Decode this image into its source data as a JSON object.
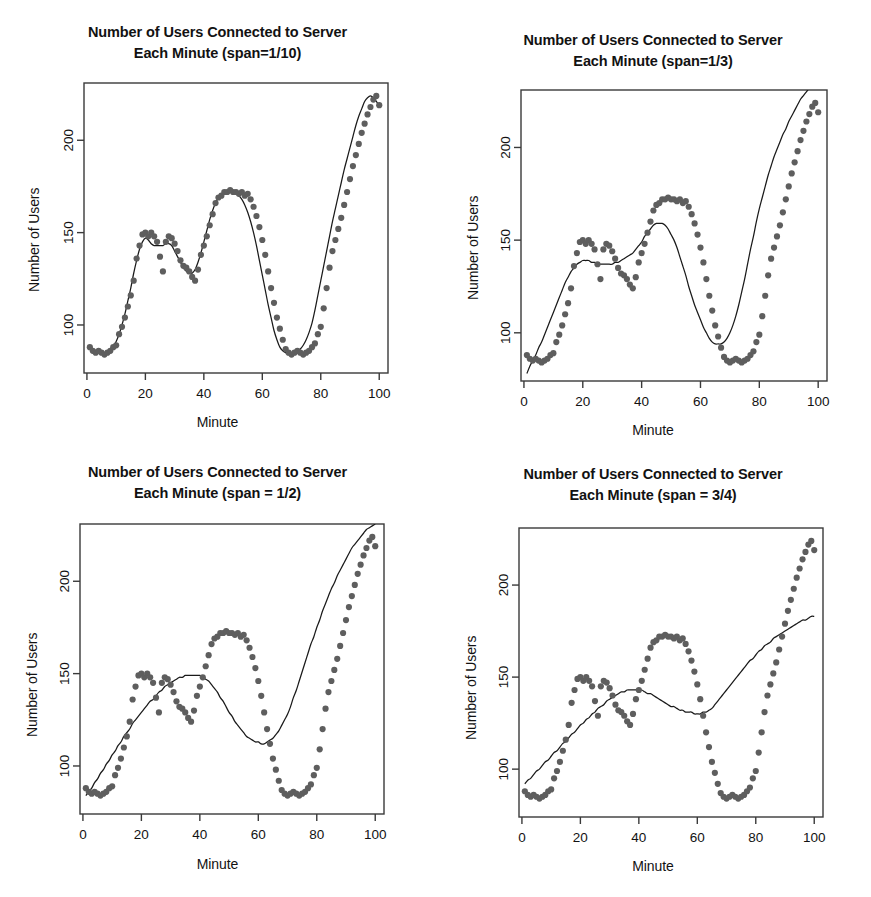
{
  "figure": {
    "width": 871,
    "height": 897,
    "background": "#ffffff",
    "point_color": "#5e5e5e",
    "line_color": "#1a1a1a",
    "axis_color": "#3a3a3a",
    "layout": "2x2 panel grid"
  },
  "chart_data": [
    {
      "id": "panel-span-1-10",
      "type": "scatter",
      "title": "Number of Users Connected to Server Each Minute (span=1/10)",
      "title_line1": "Number of Users Connected to Server",
      "title_line2": "Each Minute (span=1/10)",
      "span_label": "span=1/10",
      "span_value": 0.1,
      "xlabel": "Minute",
      "ylabel": "Number of Users",
      "xlim": [
        -1,
        103
      ],
      "ylim": [
        74,
        231
      ],
      "xticks": [
        0,
        20,
        40,
        60,
        80,
        100
      ],
      "yticks": [
        100,
        150,
        200
      ],
      "grid": false,
      "legend": "none",
      "x": [
        1,
        2,
        3,
        4,
        5,
        6,
        7,
        8,
        9,
        10,
        11,
        12,
        13,
        14,
        15,
        16,
        17,
        18,
        19,
        20,
        21,
        22,
        23,
        24,
        25,
        26,
        27,
        28,
        29,
        30,
        31,
        32,
        33,
        34,
        35,
        36,
        37,
        38,
        39,
        40,
        41,
        42,
        43,
        44,
        45,
        46,
        47,
        48,
        49,
        50,
        51,
        52,
        53,
        54,
        55,
        56,
        57,
        58,
        59,
        60,
        61,
        62,
        63,
        64,
        65,
        66,
        67,
        68,
        69,
        70,
        71,
        72,
        73,
        74,
        75,
        76,
        77,
        78,
        79,
        80,
        81,
        82,
        83,
        84,
        85,
        86,
        87,
        88,
        89,
        90,
        91,
        92,
        93,
        94,
        95,
        96,
        97,
        98,
        99,
        100
      ],
      "y": [
        88,
        86,
        85,
        86,
        85,
        84,
        85,
        86,
        88,
        89,
        95,
        99,
        104,
        110,
        116,
        124,
        136,
        143,
        149,
        150,
        148,
        150,
        148,
        145,
        137,
        129,
        145,
        148,
        147,
        144,
        140,
        135,
        132,
        131,
        129,
        126,
        124,
        130,
        138,
        143,
        148,
        154,
        160,
        166,
        169,
        170,
        172,
        172,
        173,
        172,
        172,
        171,
        172,
        170,
        171,
        168,
        164,
        159,
        153,
        146,
        138,
        129,
        120,
        112,
        104,
        98,
        92,
        87,
        85,
        84,
        85,
        86,
        85,
        84,
        85,
        86,
        88,
        90,
        95,
        99,
        109,
        120,
        131,
        140,
        146,
        152,
        158,
        165,
        172,
        179,
        186,
        192,
        198,
        204,
        209,
        214,
        218,
        222,
        224,
        219
      ],
      "smooth_y": [
        87,
        86,
        85,
        85,
        85,
        85,
        85,
        86,
        88,
        91,
        95,
        100,
        106,
        113,
        120,
        128,
        135,
        141,
        145,
        147,
        146,
        144,
        143,
        143,
        143,
        143,
        144,
        144,
        143,
        140,
        137,
        134,
        131,
        129,
        128,
        128,
        130,
        134,
        139,
        145,
        151,
        157,
        162,
        166,
        169,
        171,
        172,
        172,
        172,
        172,
        171,
        170,
        168,
        165,
        161,
        156,
        150,
        143,
        135,
        127,
        119,
        111,
        104,
        97,
        92,
        88,
        86,
        85,
        84,
        84,
        85,
        86,
        87,
        89,
        92,
        96,
        101,
        108,
        116,
        124,
        132,
        140,
        148,
        156,
        163,
        170,
        177,
        184,
        190,
        196,
        202,
        208,
        213,
        217,
        221,
        223,
        224,
        223,
        221,
        219
      ]
    },
    {
      "id": "panel-span-1-3",
      "type": "scatter",
      "title": "Number of Users Connected to Server Each Minute (span=1/3)",
      "title_line1": "Number of Users Connected to Server",
      "title_line2": "Each Minute (span=1/3)",
      "span_label": "span=1/3",
      "span_value": 0.3333,
      "xlabel": "Minute",
      "ylabel": "Number of Users",
      "xlim": [
        -1,
        103
      ],
      "ylim": [
        74,
        231
      ],
      "xticks": [
        0,
        20,
        40,
        60,
        80,
        100
      ],
      "yticks": [
        100,
        150,
        200
      ],
      "grid": false,
      "legend": "none",
      "x": [
        1,
        2,
        3,
        4,
        5,
        6,
        7,
        8,
        9,
        10,
        11,
        12,
        13,
        14,
        15,
        16,
        17,
        18,
        19,
        20,
        21,
        22,
        23,
        24,
        25,
        26,
        27,
        28,
        29,
        30,
        31,
        32,
        33,
        34,
        35,
        36,
        37,
        38,
        39,
        40,
        41,
        42,
        43,
        44,
        45,
        46,
        47,
        48,
        49,
        50,
        51,
        52,
        53,
        54,
        55,
        56,
        57,
        58,
        59,
        60,
        61,
        62,
        63,
        64,
        65,
        66,
        67,
        68,
        69,
        70,
        71,
        72,
        73,
        74,
        75,
        76,
        77,
        78,
        79,
        80,
        81,
        82,
        83,
        84,
        85,
        86,
        87,
        88,
        89,
        90,
        91,
        92,
        93,
        94,
        95,
        96,
        97,
        98,
        99,
        100
      ],
      "y": [
        88,
        86,
        85,
        86,
        85,
        84,
        85,
        86,
        88,
        89,
        95,
        99,
        104,
        110,
        116,
        124,
        136,
        143,
        149,
        150,
        148,
        150,
        148,
        145,
        137,
        129,
        145,
        148,
        147,
        144,
        140,
        135,
        132,
        131,
        129,
        126,
        124,
        130,
        138,
        143,
        148,
        154,
        160,
        166,
        169,
        170,
        172,
        172,
        173,
        172,
        172,
        171,
        172,
        170,
        171,
        168,
        164,
        159,
        153,
        146,
        138,
        129,
        120,
        112,
        104,
        98,
        92,
        87,
        85,
        84,
        85,
        86,
        85,
        84,
        85,
        86,
        88,
        90,
        95,
        99,
        109,
        120,
        131,
        140,
        146,
        152,
        158,
        165,
        172,
        179,
        186,
        192,
        198,
        204,
        209,
        214,
        218,
        222,
        224,
        219
      ],
      "smooth_y": [
        78,
        82,
        85,
        88,
        92,
        95,
        99,
        103,
        107,
        111,
        115,
        119,
        123,
        127,
        130,
        133,
        135,
        137,
        138,
        139,
        139,
        139,
        138,
        138,
        137,
        137,
        137,
        137,
        137,
        137,
        138,
        138,
        139,
        140,
        141,
        142,
        143,
        145,
        147,
        149,
        152,
        154,
        156,
        158,
        159,
        159,
        159,
        158,
        156,
        153,
        150,
        146,
        141,
        136,
        131,
        125,
        120,
        115,
        111,
        107,
        103,
        100,
        97,
        95,
        94,
        94,
        94,
        95,
        97,
        100,
        104,
        109,
        115,
        122,
        129,
        137,
        145,
        152,
        160,
        167,
        173,
        179,
        185,
        190,
        195,
        199,
        203,
        207,
        210,
        214,
        217,
        220,
        223,
        226,
        228,
        230,
        232,
        233,
        234,
        235
      ]
    },
    {
      "id": "panel-span-1-2",
      "type": "scatter",
      "title": "Number of Users Connected to Server Each Minute (span = 1/2)",
      "title_line1": "Number of Users Connected to Server",
      "title_line2": "Each Minute (span = 1/2)",
      "span_label": "span = 1/2",
      "span_value": 0.5,
      "xlabel": "Minute",
      "ylabel": "Number of Users",
      "xlim": [
        -1,
        103
      ],
      "ylim": [
        74,
        231
      ],
      "xticks": [
        0,
        20,
        40,
        60,
        80,
        100
      ],
      "yticks": [
        100,
        150,
        200
      ],
      "grid": false,
      "legend": "none",
      "x": [
        1,
        2,
        3,
        4,
        5,
        6,
        7,
        8,
        9,
        10,
        11,
        12,
        13,
        14,
        15,
        16,
        17,
        18,
        19,
        20,
        21,
        22,
        23,
        24,
        25,
        26,
        27,
        28,
        29,
        30,
        31,
        32,
        33,
        34,
        35,
        36,
        37,
        38,
        39,
        40,
        41,
        42,
        43,
        44,
        45,
        46,
        47,
        48,
        49,
        50,
        51,
        52,
        53,
        54,
        55,
        56,
        57,
        58,
        59,
        60,
        61,
        62,
        63,
        64,
        65,
        66,
        67,
        68,
        69,
        70,
        71,
        72,
        73,
        74,
        75,
        76,
        77,
        78,
        79,
        80,
        81,
        82,
        83,
        84,
        85,
        86,
        87,
        88,
        89,
        90,
        91,
        92,
        93,
        94,
        95,
        96,
        97,
        98,
        99,
        100
      ],
      "y": [
        88,
        86,
        85,
        86,
        85,
        84,
        85,
        86,
        88,
        89,
        95,
        99,
        104,
        110,
        116,
        124,
        136,
        143,
        149,
        150,
        148,
        150,
        148,
        145,
        137,
        129,
        145,
        148,
        147,
        144,
        140,
        135,
        132,
        131,
        129,
        126,
        124,
        130,
        138,
        143,
        148,
        154,
        160,
        166,
        169,
        170,
        172,
        172,
        173,
        172,
        172,
        171,
        172,
        170,
        171,
        168,
        164,
        159,
        153,
        146,
        138,
        129,
        120,
        112,
        104,
        98,
        92,
        87,
        85,
        84,
        85,
        86,
        85,
        84,
        85,
        86,
        88,
        90,
        95,
        99,
        109,
        120,
        131,
        140,
        146,
        152,
        158,
        165,
        172,
        179,
        186,
        192,
        198,
        204,
        209,
        214,
        218,
        222,
        224,
        219
      ],
      "smooth_y": [
        84,
        86,
        88,
        91,
        93,
        96,
        98,
        101,
        103,
        106,
        108,
        111,
        113,
        116,
        118,
        120,
        123,
        125,
        127,
        129,
        131,
        133,
        135,
        136,
        138,
        140,
        141,
        143,
        144,
        145,
        146,
        147,
        148,
        148,
        149,
        149,
        149,
        149,
        149,
        149,
        148,
        147,
        146,
        144,
        142,
        140,
        137,
        135,
        132,
        129,
        127,
        124,
        122,
        120,
        118,
        116,
        115,
        114,
        113,
        113,
        112,
        112,
        113,
        114,
        115,
        117,
        119,
        122,
        125,
        128,
        132,
        137,
        141,
        146,
        151,
        156,
        161,
        166,
        170,
        175,
        179,
        184,
        188,
        192,
        196,
        199,
        203,
        206,
        209,
        212,
        215,
        218,
        220,
        222,
        224,
        226,
        228,
        229,
        230,
        231
      ]
    },
    {
      "id": "panel-span-3-4",
      "type": "scatter",
      "title": "Number of Users Connected to Server Each Minute (span = 3/4)",
      "title_line1": "Number of Users Connected to Server",
      "title_line2": "Each Minute (span = 3/4)",
      "span_label": "span = 3/4",
      "span_value": 0.75,
      "xlabel": "Minute",
      "ylabel": "Number of Users",
      "xlim": [
        -1,
        103
      ],
      "ylim": [
        74,
        231
      ],
      "xticks": [
        0,
        20,
        40,
        60,
        80,
        100
      ],
      "yticks": [
        100,
        150,
        200
      ],
      "grid": false,
      "legend": "none",
      "x": [
        1,
        2,
        3,
        4,
        5,
        6,
        7,
        8,
        9,
        10,
        11,
        12,
        13,
        14,
        15,
        16,
        17,
        18,
        19,
        20,
        21,
        22,
        23,
        24,
        25,
        26,
        27,
        28,
        29,
        30,
        31,
        32,
        33,
        34,
        35,
        36,
        37,
        38,
        39,
        40,
        41,
        42,
        43,
        44,
        45,
        46,
        47,
        48,
        49,
        50,
        51,
        52,
        53,
        54,
        55,
        56,
        57,
        58,
        59,
        60,
        61,
        62,
        63,
        64,
        65,
        66,
        67,
        68,
        69,
        70,
        71,
        72,
        73,
        74,
        75,
        76,
        77,
        78,
        79,
        80,
        81,
        82,
        83,
        84,
        85,
        86,
        87,
        88,
        89,
        90,
        91,
        92,
        93,
        94,
        95,
        96,
        97,
        98,
        99,
        100
      ],
      "y": [
        88,
        86,
        85,
        86,
        85,
        84,
        85,
        86,
        88,
        89,
        95,
        99,
        104,
        110,
        116,
        124,
        136,
        143,
        149,
        150,
        148,
        150,
        148,
        145,
        137,
        129,
        145,
        148,
        147,
        144,
        140,
        135,
        132,
        131,
        129,
        126,
        124,
        130,
        138,
        143,
        148,
        154,
        160,
        166,
        169,
        170,
        172,
        172,
        173,
        172,
        172,
        171,
        172,
        170,
        171,
        168,
        164,
        159,
        153,
        146,
        138,
        129,
        120,
        112,
        104,
        98,
        92,
        87,
        85,
        84,
        85,
        86,
        85,
        84,
        85,
        86,
        88,
        90,
        95,
        99,
        109,
        120,
        131,
        140,
        146,
        152,
        158,
        165,
        172,
        179,
        186,
        192,
        198,
        204,
        209,
        214,
        218,
        222,
        224,
        219
      ],
      "smooth_y": [
        92,
        94,
        95,
        97,
        99,
        100,
        102,
        104,
        105,
        107,
        109,
        110,
        112,
        114,
        115,
        117,
        119,
        120,
        122,
        124,
        125,
        127,
        128,
        130,
        131,
        133,
        134,
        135,
        137,
        138,
        139,
        140,
        141,
        142,
        142,
        143,
        143,
        143,
        143,
        143,
        143,
        142,
        141,
        141,
        140,
        139,
        138,
        137,
        136,
        135,
        134,
        134,
        133,
        132,
        132,
        131,
        131,
        131,
        130,
        130,
        130,
        131,
        131,
        132,
        133,
        135,
        137,
        139,
        141,
        143,
        145,
        147,
        149,
        151,
        153,
        155,
        157,
        159,
        160,
        162,
        164,
        165,
        167,
        168,
        169,
        171,
        172,
        173,
        174,
        175,
        176,
        177,
        178,
        179,
        180,
        181,
        181,
        182,
        183,
        183
      ]
    }
  ]
}
